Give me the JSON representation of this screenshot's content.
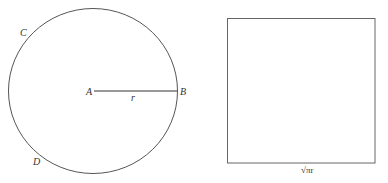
{
  "figure": {
    "circle": {
      "center_x": 93,
      "center_y": 91,
      "radius": 84,
      "stroke": "#555555",
      "points": {
        "A": "A",
        "B": "B",
        "C": "C",
        "D": "D"
      },
      "radius_label": "r"
    },
    "square": {
      "x": 227,
      "y": 18,
      "width": 148,
      "height": 145,
      "stroke": "#666666",
      "side_label": "√πr"
    }
  }
}
